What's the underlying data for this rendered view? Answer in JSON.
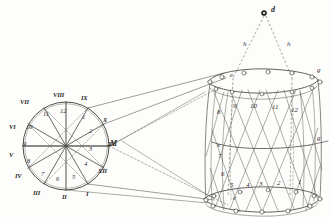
{
  "figure": {
    "background_color": "#fdfdfc",
    "ink_color": "#2b2b28"
  },
  "circle_diagram": {
    "name": "twelve-division-circle",
    "center_label": "",
    "right_vertex_label": "M",
    "roman_numerals": [
      {
        "label": "I",
        "x": 88,
        "y": 196
      },
      {
        "label": "II",
        "x": 65,
        "y": 199
      },
      {
        "label": "III",
        "x": 37,
        "y": 193
      },
      {
        "label": "IV",
        "x": 18,
        "y": 176
      },
      {
        "label": "V",
        "x": 11,
        "y": 155
      },
      {
        "label": "VI",
        "x": 12,
        "y": 127
      },
      {
        "label": "VII",
        "x": 23,
        "y": 102
      },
      {
        "label": "VIII",
        "x": 57,
        "y": 94
      },
      {
        "label": "IX",
        "x": 83,
        "y": 98
      },
      {
        "label": "X",
        "x": 104,
        "y": 120
      },
      {
        "label": "XI",
        "x": 110,
        "y": 145
      },
      {
        "label": "XII",
        "x": 101,
        "y": 172
      }
    ],
    "arabic_numerals": [
      {
        "label": "1",
        "x": 83,
        "y": 118
      },
      {
        "label": "2",
        "x": 90,
        "y": 132
      },
      {
        "label": "3",
        "x": 90,
        "y": 150
      },
      {
        "label": "4",
        "x": 85,
        "y": 165
      },
      {
        "label": "5",
        "x": 73,
        "y": 178
      },
      {
        "label": "6",
        "x": 58,
        "y": 180
      },
      {
        "label": "7",
        "x": 42,
        "y": 175
      },
      {
        "label": "8",
        "x": 29,
        "y": 162
      },
      {
        "label": "9",
        "x": 24,
        "y": 145
      },
      {
        "label": "10",
        "x": 29,
        "y": 128
      },
      {
        "label": "11",
        "x": 45,
        "y": 115
      },
      {
        "label": "12",
        "x": 63,
        "y": 112
      }
    ]
  },
  "basket_diagram": {
    "name": "woven-basket-perspective",
    "apex_point": {
      "label": "d",
      "x": 272,
      "y": 11
    },
    "apex_dot": {
      "x": 264,
      "y": 13
    },
    "dashed_labels": [
      {
        "label": "h",
        "x": 244,
        "y": 45
      },
      {
        "label": "h",
        "x": 288,
        "y": 45
      }
    ],
    "upper_rim_label": {
      "label": "e",
      "x": 231,
      "y": 76
    },
    "lower_rim_label": {
      "label": "c",
      "x": 234,
      "y": 199
    },
    "side_labels": [
      {
        "label": "g",
        "x": 318,
        "y": 71
      },
      {
        "label": "g",
        "x": 318,
        "y": 139
      }
    ],
    "cross_label": {
      "label": "x",
      "x": 218,
      "y": 146
    },
    "upper_numbers": [
      {
        "label": "8",
        "x": 218,
        "y": 113
      },
      {
        "label": "9",
        "x": 234,
        "y": 107
      },
      {
        "label": "10",
        "x": 252,
        "y": 107
      },
      {
        "label": "11",
        "x": 274,
        "y": 108
      },
      {
        "label": "12",
        "x": 293,
        "y": 111
      }
    ],
    "lower_numbers": [
      {
        "label": "7",
        "x": 219,
        "y": 157
      },
      {
        "label": "6",
        "x": 222,
        "y": 175
      },
      {
        "label": "5",
        "x": 231,
        "y": 186
      },
      {
        "label": "4",
        "x": 247,
        "y": 186
      },
      {
        "label": "3",
        "x": 260,
        "y": 185
      },
      {
        "label": "2",
        "x": 278,
        "y": 184
      },
      {
        "label": "1",
        "x": 299,
        "y": 183
      }
    ]
  }
}
